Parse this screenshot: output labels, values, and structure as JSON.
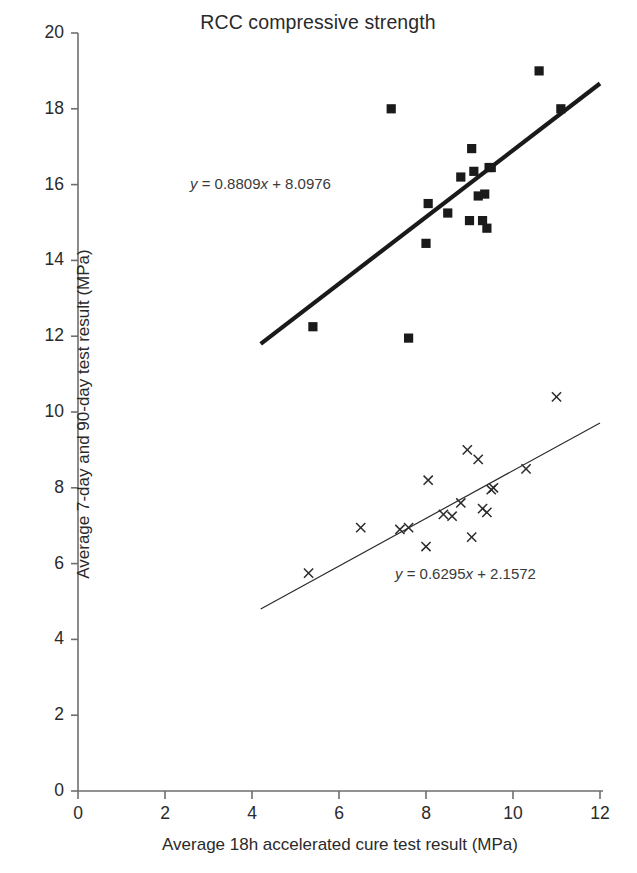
{
  "chart_data": {
    "type": "scatter",
    "title": "RCC compressive strength",
    "xlabel": "Average 18h accelerated cure test result (MPa)",
    "ylabel": "Average 7-day and 90-day test result (MPa)",
    "xlim": [
      0,
      12
    ],
    "ylim": [
      0,
      20
    ],
    "xticks": [
      0,
      2,
      4,
      6,
      8,
      10,
      12
    ],
    "yticks": [
      0,
      2,
      4,
      6,
      8,
      10,
      12,
      14,
      16,
      18,
      20
    ],
    "grid": false,
    "legend": "none",
    "series": [
      {
        "name": "90-day test result",
        "marker": "square",
        "color": "#1a1a1a",
        "points": [
          [
            5.4,
            12.25
          ],
          [
            7.2,
            18.0
          ],
          [
            7.6,
            11.95
          ],
          [
            8.0,
            14.45
          ],
          [
            8.05,
            15.5
          ],
          [
            8.5,
            15.25
          ],
          [
            8.8,
            16.2
          ],
          [
            9.0,
            15.05
          ],
          [
            9.05,
            16.95
          ],
          [
            9.1,
            16.35
          ],
          [
            9.2,
            15.7
          ],
          [
            9.3,
            15.05
          ],
          [
            9.35,
            15.75
          ],
          [
            9.4,
            14.85
          ],
          [
            9.45,
            16.45
          ],
          [
            9.5,
            16.45
          ],
          [
            10.6,
            19.0
          ],
          [
            11.1,
            18.0
          ]
        ],
        "trendline": {
          "equation": "y = 0.8809x + 8.0976",
          "slope": 0.8809,
          "intercept": 8.0976,
          "x_start": 4.2,
          "x_end": 12.0,
          "weight": "thick"
        }
      },
      {
        "name": "7-day test result",
        "marker": "cross",
        "color": "#2b2b2b",
        "points": [
          [
            5.3,
            5.75
          ],
          [
            6.5,
            6.95
          ],
          [
            7.4,
            6.9
          ],
          [
            7.6,
            6.95
          ],
          [
            8.0,
            6.45
          ],
          [
            8.05,
            8.2
          ],
          [
            8.4,
            7.3
          ],
          [
            8.6,
            7.25
          ],
          [
            8.8,
            7.6
          ],
          [
            8.95,
            9.0
          ],
          [
            9.05,
            6.7
          ],
          [
            9.2,
            8.75
          ],
          [
            9.3,
            7.45
          ],
          [
            9.4,
            7.35
          ],
          [
            9.5,
            7.95
          ],
          [
            9.55,
            8.0
          ],
          [
            10.3,
            8.5
          ],
          [
            11.0,
            10.4
          ]
        ],
        "trendline": {
          "equation": "y = 0.6295x + 2.1572",
          "slope": 0.6295,
          "intercept": 2.1572,
          "x_start": 4.2,
          "x_end": 12.0,
          "weight": "thin"
        }
      }
    ],
    "annotations": [
      {
        "text": "y = 0.8809x + 8.0976",
        "x": 6.0,
        "y": 16.3
      },
      {
        "text": "y = 0.6295x + 2.1572",
        "x": 9.2,
        "y": 5.6
      }
    ]
  },
  "axes": {
    "title": "RCC compressive strength",
    "x_title": "Average 18h accelerated cure test result (MPa)",
    "y_title": "Average 7-day and 90-day test result (MPa)",
    "x_tick_labels": [
      "0",
      "2",
      "4",
      "6",
      "8",
      "10",
      "12"
    ],
    "y_tick_labels": [
      "0",
      "2",
      "4",
      "6",
      "8",
      "10",
      "12",
      "14",
      "16",
      "18",
      "20"
    ],
    "axis_color": "#6e6e6e"
  },
  "equations": {
    "upper_prefix": "y",
    "upper_body": " = 0.8809",
    "upper_var": "x",
    "upper_suffix": " + 8.0976",
    "lower_prefix": "y",
    "lower_body": " = 0.6295",
    "lower_var": "x",
    "lower_suffix": " + 2.1572"
  }
}
